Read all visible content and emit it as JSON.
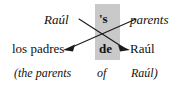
{
  "figure": {
    "highlight_color": "#c9c9c9",
    "text_color": "#111111",
    "background_color": "#ffffff"
  },
  "rows": {
    "english": {
      "left": "Raúl",
      "marker": "'s",
      "right": "parents"
    },
    "spanish": {
      "left": "los padres",
      "marker": "de",
      "right": "Raúl"
    },
    "literal": {
      "left": "(the parents",
      "marker": "of",
      "right": "Raúl)"
    }
  },
  "arrows": [
    {
      "name": "arrow-raul-to-right",
      "from": "english.left",
      "to": "spanish.right",
      "direction": "down-right"
    },
    {
      "name": "arrow-parents-to-left",
      "from": "english.right",
      "to": "spanish.left",
      "direction": "down-left"
    }
  ]
}
